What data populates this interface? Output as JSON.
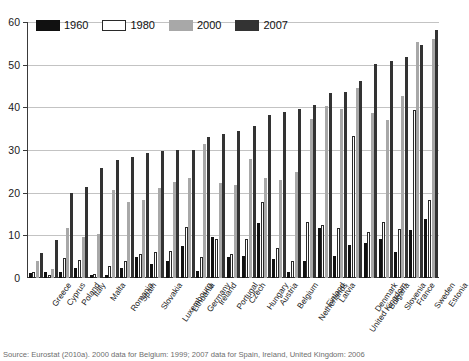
{
  "chart_data": {
    "type": "bar",
    "title": "",
    "xlabel": "",
    "ylabel": "",
    "ylim": [
      0,
      60
    ],
    "yticks": [
      0,
      10,
      20,
      30,
      40,
      50,
      60
    ],
    "grid": true,
    "legend_position": "top-left",
    "categories": [
      "Greece",
      "Cyprus",
      "Poland",
      "Italy",
      "Malta",
      "Romania",
      "Spain",
      "Slovakia",
      "Luxembourg",
      "Lithuania",
      "Germany",
      "Ireland",
      "Portugal",
      "Czech",
      "Hungary",
      "Austria",
      "Belgium",
      "Netherlands",
      "Finland",
      "Latvia",
      "United Kingdom",
      "Denmark",
      "Bulgaria",
      "Slovenia",
      "France",
      "Sweden",
      "Estonia"
    ],
    "series": [
      {
        "name": "1960",
        "color": "#111111",
        "values": [
          1.2,
          1.4,
          1.5,
          2.4,
          0.7,
          0.8,
          2.3,
          5.0,
          3.2,
          3.9,
          7.5,
          1.6,
          9.5,
          4.9,
          5.2,
          13.0,
          4.4,
          1.3,
          4.1,
          11.7,
          5.2,
          7.8,
          8.2,
          9.1,
          6.1,
          11.3,
          13.9
        ]
      },
      {
        "name": "1980",
        "color": "#ffffff",
        "values": [
          1.5,
          0.6,
          4.8,
          4.3,
          1.0,
          2.8,
          3.9,
          5.6,
          6.0,
          6.3,
          11.9,
          5.0,
          9.2,
          5.6,
          9.1,
          17.8,
          7.1,
          4.1,
          13.1,
          12.5,
          11.8,
          33.2,
          10.9,
          13.1,
          11.4,
          39.4,
          18.3
        ]
      },
      {
        "name": "2000",
        "color": "#a8a8a8",
        "values": [
          3.9,
          2.0,
          11.7,
          9.7,
          10.2,
          20.7,
          17.7,
          18.2,
          21.2,
          22.5,
          23.4,
          31.5,
          22.2,
          21.8,
          28.0,
          23.4,
          22.9,
          24.9,
          37.2,
          40.3,
          39.5,
          44.6,
          38.6,
          37.1,
          42.6,
          55.3,
          56.0
        ]
      },
      {
        "name": "2007",
        "color": "#333333",
        "values": [
          5.8,
          8.9,
          20.0,
          21.3,
          25.9,
          27.7,
          28.3,
          29.4,
          29.8,
          29.9,
          30.0,
          33.1,
          33.7,
          34.5,
          35.7,
          38.1,
          39.0,
          39.5,
          40.6,
          43.3,
          43.7,
          46.1,
          50.2,
          50.8,
          51.7,
          54.7,
          58.2
        ]
      }
    ]
  },
  "legend": {
    "entries": [
      {
        "label": "1960",
        "key": "s1960"
      },
      {
        "label": "1980",
        "key": "s1980"
      },
      {
        "label": "2000",
        "key": "s2000"
      },
      {
        "label": "2007",
        "key": "s2007"
      }
    ]
  },
  "source_note": "Source: Eurostat (2010a). 2000 data for Belgium: 1999; 2007 data for Spain, Ireland, United Kingdom: 2006"
}
